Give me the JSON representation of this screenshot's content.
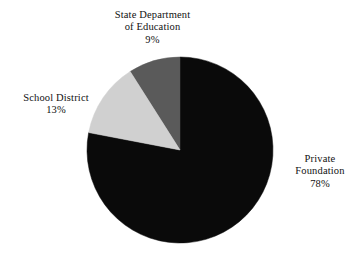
{
  "chart_data": {
    "type": "pie",
    "title": "",
    "subtitle": "",
    "xlabel": "",
    "ylabel": "",
    "grid": false,
    "legend_position": "none",
    "label_format": "name + percent",
    "start_angle_deg": 0,
    "direction": "clockwise",
    "categories": [
      "Private Foundation",
      "School District",
      "State Department of Education"
    ],
    "values": [
      78,
      13,
      9
    ],
    "units": "percent",
    "total": 100,
    "slices": [
      {
        "name": "Private Foundation",
        "name_line1": "Private",
        "name_line2": "Foundation",
        "value": 78,
        "percent_label": "78%",
        "color": "#0a0a0a"
      },
      {
        "name": "School District",
        "name_line1": "School District",
        "name_line2": "",
        "value": 13,
        "percent_label": "13%",
        "color": "#d0d0d0"
      },
      {
        "name": "State Department of Education",
        "name_line1": "State Department",
        "name_line2": "of Education",
        "value": 9,
        "percent_label": "9%",
        "color": "#5a5a5a"
      }
    ]
  },
  "figure": {
    "background_color": "#ffffff",
    "geometry": {
      "center_x": 180,
      "center_y": 150,
      "radius": 93
    }
  }
}
